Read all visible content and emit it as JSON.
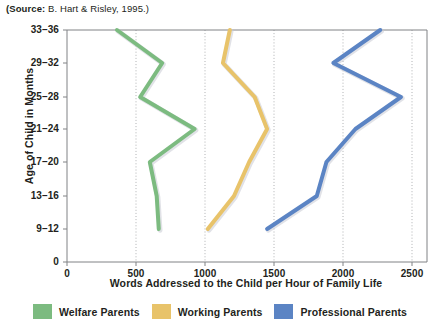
{
  "source_note": {
    "bold_prefix": "(Source:",
    "rest": " B. Hart & Risley, 1995.)"
  },
  "chart_data": {
    "type": "line",
    "orientation": "horizontal-value-vertical-category",
    "title": "",
    "subtitle": "",
    "xlabel": "Words Addressed to the Child per Hour of Family Life",
    "ylabel": "Age of Child in Months",
    "categories": [
      "9–12",
      "13–16",
      "17–20",
      "21–24",
      "25–28",
      "29–32",
      "33–36"
    ],
    "ytick_labels": [
      "0",
      "9–12",
      "13–16",
      "17–20",
      "21–24",
      "25–28",
      "29–32",
      "33–36"
    ],
    "xtick_labels": [
      "0",
      "500",
      "1000",
      "1500",
      "2000",
      "2500"
    ],
    "xticks": [
      0,
      500,
      1000,
      1500,
      2000,
      2500
    ],
    "xlim": [
      0,
      2600
    ],
    "grid": "vertical-dotted",
    "legend_position": "bottom",
    "series": [
      {
        "name": "Welfare Parents",
        "color": "#7cbb80",
        "values": [
          665,
          650,
          600,
          925,
          530,
          690,
          362
        ]
      },
      {
        "name": "Working Parents",
        "color": "#e8c36a",
        "values": [
          1020,
          1210,
          1320,
          1450,
          1360,
          1130,
          1180
        ]
      },
      {
        "name": "Professional Parents",
        "color": "#5b84c4",
        "values": [
          1450,
          1810,
          1880,
          2090,
          2420,
          1930,
          2270
        ]
      }
    ]
  },
  "legend": {
    "items": [
      {
        "label": "Welfare Parents",
        "color": "#7cbb80"
      },
      {
        "label": "Working Parents",
        "color": "#e8c36a"
      },
      {
        "label": "Professional Parents",
        "color": "#5b84c4"
      }
    ]
  },
  "colors": {
    "welfare": "#7cbb80",
    "working": "#e8c36a",
    "professional": "#5b84c4",
    "axis": "#808285",
    "grid": "#a7a9ac",
    "text": "#231f20"
  }
}
